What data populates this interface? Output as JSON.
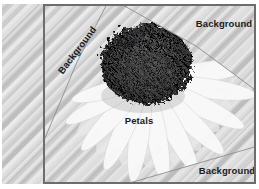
{
  "figure": {
    "regions": {
      "top_left": "Background",
      "top_right": "Background",
      "bottom_right": "Background",
      "bud": "Bud",
      "petals": "Petals"
    },
    "colors": {
      "frame_border": "#6d6d6d",
      "region_line": "#8f8f8f",
      "label_text": "#1b1b1b",
      "stripe_dark": "#c7c7c7",
      "stripe_light": "#dadada",
      "petal": "#f9f9f9",
      "bud": "#6e6e6e"
    }
  }
}
